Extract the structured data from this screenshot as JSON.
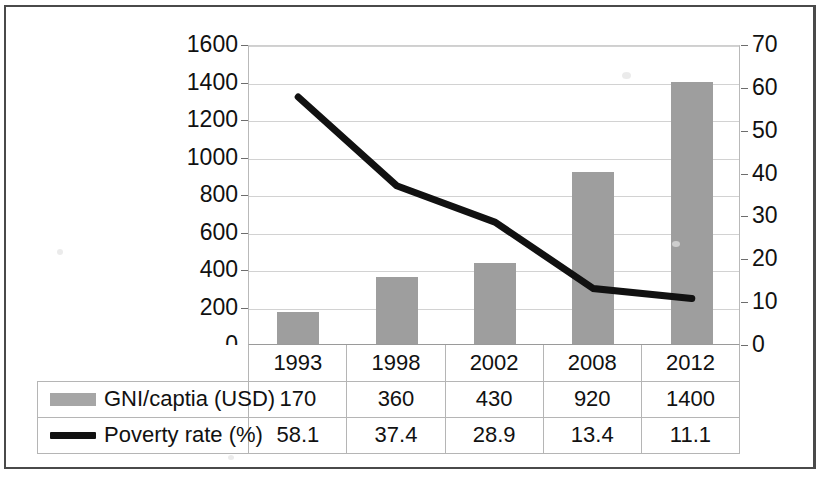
{
  "figure": {
    "frame": true,
    "accent_bar_color": "#9e9e9e",
    "line_color": "#111111"
  },
  "axes": {
    "left_ticks": [
      "1600",
      "1400",
      "1200",
      "1000",
      "800",
      "600",
      "400",
      "200",
      "0"
    ],
    "right_ticks": [
      "70",
      "60",
      "50",
      "40",
      "30",
      "20",
      "10",
      "0"
    ]
  },
  "table": {
    "year_row": [
      "1993",
      "1998",
      "2002",
      "2008",
      "2012"
    ],
    "rows": [
      {
        "legend_label": "GNI/captia (USD)",
        "legend_marker": "bar-swatch-icon",
        "values": [
          "170",
          "360",
          "430",
          "920",
          "1400"
        ]
      },
      {
        "legend_label": "Poverty rate (%)",
        "legend_marker": "line-swatch-icon",
        "values": [
          "58.1",
          "37.4",
          "28.9",
          "13.4",
          "11.1"
        ]
      }
    ]
  },
  "chart_data": {
    "type": "bar",
    "title": "",
    "subtitle": "",
    "xlabel": "",
    "categories": [
      "1993",
      "1998",
      "2002",
      "2008",
      "2012"
    ],
    "grid": true,
    "legend_position": "bottom-table",
    "series": [
      {
        "name": "GNI/captia (USD)",
        "type": "bar",
        "axis": "left",
        "color": "#9e9e9e",
        "values": [
          170,
          360,
          430,
          920,
          1400
        ]
      },
      {
        "name": "Poverty rate (%)",
        "type": "line",
        "axis": "right",
        "color": "#111111",
        "values": [
          58.1,
          37.4,
          28.9,
          13.4,
          11.1
        ]
      }
    ],
    "ylabel_left": "GNI/captia (USD)",
    "ylabel_right": "Poverty rate (%)",
    "ylim_left": [
      0,
      1600
    ],
    "ytick_left": [
      0,
      200,
      400,
      600,
      800,
      1000,
      1200,
      1400,
      1600
    ],
    "ylim_right": [
      0,
      70
    ],
    "ytick_right": [
      0,
      10,
      20,
      30,
      40,
      50,
      60,
      70
    ]
  }
}
